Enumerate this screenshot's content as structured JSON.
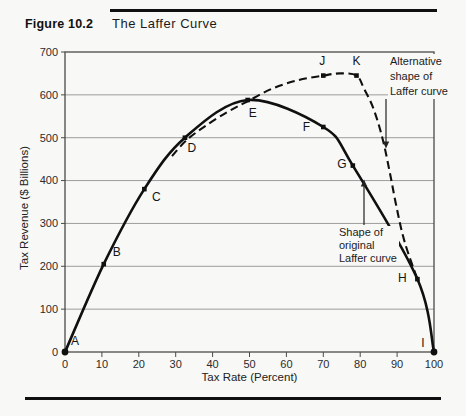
{
  "figure": {
    "label": "Figure 10.2",
    "title": "The Laffer Curve"
  },
  "chart_data": {
    "type": "line",
    "title": "The Laffer Curve",
    "xlabel": "Tax Rate (Percent)",
    "ylabel": "Tax Revenue ($ Billions)",
    "xlim": [
      0,
      100
    ],
    "ylim": [
      0,
      700
    ],
    "x_ticks": [
      0,
      10,
      20,
      30,
      40,
      50,
      60,
      70,
      80,
      90,
      100
    ],
    "y_ticks": [
      0,
      100,
      200,
      300,
      400,
      500,
      600,
      700
    ],
    "grid": "horizontal-only",
    "legend_position": "none",
    "series": [
      {
        "name": "Shape of original Laffer curve",
        "style": "solid",
        "points": [
          {
            "label": "A",
            "x": 0,
            "y": 0,
            "big_dot": true,
            "label_dx": 10,
            "label_dy": -11
          },
          {
            "label": "B",
            "x": 10.5,
            "y": 205,
            "label_dx": 13,
            "label_dy": -12
          },
          {
            "label": "C",
            "x": 21.5,
            "y": 380,
            "label_dx": 12,
            "label_dy": 8
          },
          {
            "label": "D",
            "x": 32.5,
            "y": 500,
            "label_dx": 7,
            "label_dy": 10
          },
          {
            "label": "E",
            "x": 49.5,
            "y": 588,
            "label_dx": 5,
            "label_dy": 13
          },
          {
            "label": "F",
            "x": 70,
            "y": 525,
            "label_dx": -17,
            "label_dy": 0
          },
          {
            "label": "G",
            "x": 78,
            "y": 435,
            "label_dx": -11,
            "label_dy": -2
          },
          {
            "label": "H",
            "x": 95.5,
            "y": 170,
            "label_dx": -15,
            "label_dy": -1
          },
          {
            "label": "I",
            "x": 100,
            "y": 0,
            "big_dot": true,
            "label_dx": -11,
            "label_dy": -9
          }
        ]
      },
      {
        "name": "Alternative shape of Laffer curve",
        "style": "dashed",
        "points": [
          {
            "x": 29,
            "y": 457
          },
          {
            "x": 33,
            "y": 495
          },
          {
            "x": 38,
            "y": 527
          },
          {
            "x": 44,
            "y": 560
          },
          {
            "x": 49.5,
            "y": 585
          },
          {
            "x": 56,
            "y": 614
          },
          {
            "x": 63,
            "y": 634
          },
          {
            "label": "J",
            "x": 70,
            "y": 645,
            "label_dx": -1,
            "label_dy": -15
          },
          {
            "x": 74.5,
            "y": 650
          },
          {
            "label": "K",
            "x": 79,
            "y": 645,
            "label_dx": 0,
            "label_dy": -15
          },
          {
            "x": 81,
            "y": 615
          },
          {
            "x": 83.5,
            "y": 570
          },
          {
            "x": 86,
            "y": 500
          },
          {
            "x": 88,
            "y": 420
          },
          {
            "x": 89.8,
            "y": 340
          },
          {
            "x": 92,
            "y": 258
          },
          {
            "x": 95.5,
            "y": 170
          }
        ]
      }
    ],
    "annotations": [
      {
        "id": "alternative",
        "lines": [
          "Alternative",
          "shape of",
          "Laffer curve"
        ],
        "text_x": 388,
        "text_y": 54,
        "line_height": 15,
        "arrow": {
          "x1": 386,
          "y1": 99,
          "x2": 386,
          "y2": 144,
          "dir": "down"
        }
      },
      {
        "id": "original",
        "lines": [
          "Shape of",
          "original",
          "Laffer curve"
        ],
        "text_x": 337,
        "text_y": 226,
        "line_height": 13,
        "arrow": {
          "x1": 364,
          "y1": 225,
          "x2": 364,
          "y2": 184,
          "dir": "up"
        }
      }
    ],
    "colors": {
      "ink": "#101010",
      "grid": "#9c9c9c",
      "paper": "#f8f8f6"
    }
  }
}
